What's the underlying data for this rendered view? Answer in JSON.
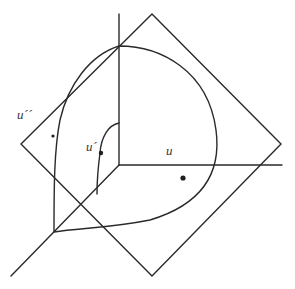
{
  "diagram": {
    "type": "3d-coordinate-sketch",
    "labels": {
      "u_double_prime": "u´´",
      "u_prime": "u´",
      "u": "u"
    },
    "colors": {
      "stroke": "#2a2a2a",
      "background": "#ffffff"
    },
    "elements": [
      "vertical axis",
      "horizontal axis",
      "diagonal axis",
      "tilted square plane",
      "spherical-triangle surface patch",
      "inner arc",
      "points u´´, u´, u"
    ]
  }
}
